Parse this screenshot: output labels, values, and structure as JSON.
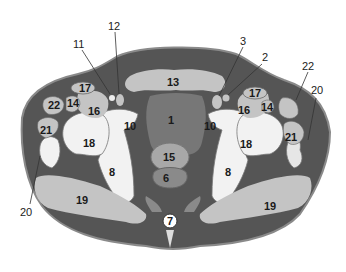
{
  "colors": {
    "skin_fat": "#555555",
    "outline": "#8a8a8a",
    "muscle_light": "#c4c4c4",
    "muscle_mid": "#a8a8a8",
    "bone": "#f2f2f2",
    "bladder": "#777777",
    "rectum": "#9a9a9a",
    "dark_fill": "#3f3f3f",
    "background": "#ffffff"
  },
  "structures": {
    "s1": "1",
    "s2": "2",
    "s3": "3",
    "s6": "6",
    "s7": "7",
    "s8_left": "8",
    "s8_right": "8",
    "s10_left": "10",
    "s10_right": "10",
    "s11": "11",
    "s12": "12",
    "s13": "13",
    "s14_left": "14",
    "s14_right": "14",
    "s15": "15",
    "s16_left": "16",
    "s16_right": "16",
    "s17_left": "17",
    "s17_right": "17",
    "s18_left": "18",
    "s18_right": "18",
    "s19_left": "19",
    "s19_right": "19",
    "s20_left": "20",
    "s20_right": "20",
    "s21_left": "21",
    "s21_right": "21",
    "s22_left": "22",
    "s22_right": "22"
  }
}
